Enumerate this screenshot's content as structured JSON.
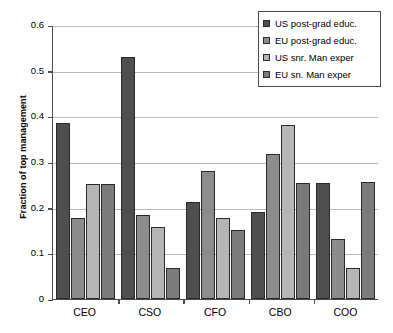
{
  "chart_data": {
    "type": "bar",
    "title": "",
    "xlabel": "",
    "ylabel": "Fraction of top management",
    "ylim": [
      0,
      0.6
    ],
    "yticks": [
      "0",
      "0.1",
      "0.2",
      "0.3",
      "0.4",
      "0.5",
      "0.6"
    ],
    "ytick_values": [
      0,
      0.1,
      0.2,
      0.3,
      0.4,
      0.5,
      0.6
    ],
    "grid": true,
    "legend_position": "top-right",
    "categories": [
      "CEO",
      "CSO",
      "CFO",
      "CBO",
      "COO"
    ],
    "series": [
      {
        "name": "US post-grad educ.",
        "color": "#4f4f4f",
        "values": [
          0.385,
          0.531,
          0.213,
          0.19,
          0.255
        ]
      },
      {
        "name": "EU post-grad educ.",
        "color": "#8c8c8c",
        "values": [
          0.178,
          0.184,
          0.281,
          0.317,
          0.131
        ]
      },
      {
        "name": "US snr. Man exper",
        "color": "#b5b5b5",
        "values": [
          0.252,
          0.158,
          0.178,
          0.381,
          0.067
        ]
      },
      {
        "name": "EU sn. Man exper",
        "color": "#7b7b7b",
        "values": [
          0.252,
          0.068,
          0.151,
          0.255,
          0.256
        ]
      }
    ]
  }
}
